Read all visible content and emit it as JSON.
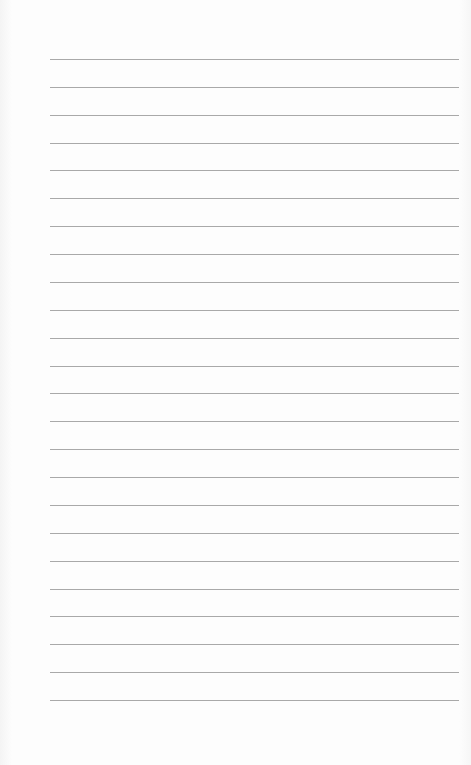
{
  "page": {
    "type": "lined-paper",
    "background_color": "#fdfdfd",
    "rule_color": "#a9a9a9"
  },
  "rules": {
    "count": 24,
    "first_y": 59,
    "spacing": 27.87,
    "left": 50,
    "right": 459
  },
  "lines_text": [
    "",
    "",
    "",
    "",
    "",
    "",
    "",
    "",
    "",
    "",
    "",
    "",
    "",
    "",
    "",
    "",
    "",
    "",
    "",
    "",
    "",
    "",
    "",
    ""
  ]
}
